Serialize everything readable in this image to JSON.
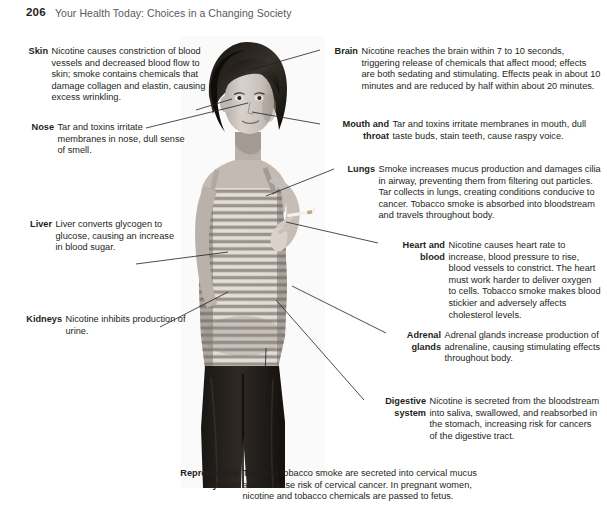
{
  "page": {
    "folio": "206",
    "book_title": "Your Health Today: Choices in a Changing Society"
  },
  "figure": {
    "photo_alt": "woman-holding-cigarette-photo",
    "photo_description": "Black and white photograph of a young woman in a horizontally striped tank top and dark pants, standing and holding a lit cigarette near her face."
  },
  "callouts": {
    "skin": {
      "term": "Skin",
      "text": "Nicotine causes constriction of blood vessels and decreased blood flow to skin; smoke contains chemicals that damage collagen and elastin, causing excess wrinkling."
    },
    "nose": {
      "term": "Nose",
      "text": "Tar and toxins irritate membranes in nose, dull sense of smell."
    },
    "liver": {
      "term": "Liver",
      "text": "Liver converts glycogen to glucose, causing an increase in blood sugar."
    },
    "kidneys": {
      "term": "Kidneys",
      "text": "Nicotine inhibits production of urine."
    },
    "brain": {
      "term": "Brain",
      "text": "Nicotine reaches the brain within 7 to 10 seconds, triggering release of chemicals that affect mood; effects are both sedating and stimulating. Effects peak in about 10 minutes and are reduced by half within about 20 minutes."
    },
    "mouth_throat": {
      "term": "Mouth and throat",
      "text": "Tar and toxins irritate membranes in mouth, dull taste buds, stain teeth, cause raspy voice."
    },
    "lungs": {
      "term": "Lungs",
      "text": "Smoke increases mucus production and damages cilia in airway, preventing them from filtering out particles. Tar collects in lungs, creating conditions conducive to cancer. Tobacco smoke is absorbed into bloodstream and travels throughout body."
    },
    "heart_blood": {
      "term": "Heart and blood",
      "text": "Nicotine causes heart rate to increase, blood pressure to rise, blood vessels to constrict. The heart must work harder to deliver oxygen to cells. Tobacco smoke makes blood stickier and adversely affects cholesterol levels."
    },
    "adrenal_glands": {
      "term": "Adrenal glands",
      "text": "Adrenal glands increase production of adrenaline, causing stimulating effects throughout body."
    },
    "digestive_system": {
      "term": "Digestive system",
      "text": "Nicotine is secreted from the bloodstream into saliva, swallowed, and reabsorbed in the stomach, increasing risk for cancers of the digestive tract."
    },
    "reproductive_system": {
      "term": "Reproductive system",
      "text": "Toxins in tobacco smoke are secreted into cervical mucus and increase risk of cervical cancer. In pregnant women, nicotine and tobacco chemicals are passed to fetus."
    }
  },
  "colors": {
    "text": "#231f20",
    "runhead": "#58595b",
    "leader_line": "#231f20",
    "background": "#ffffff"
  }
}
